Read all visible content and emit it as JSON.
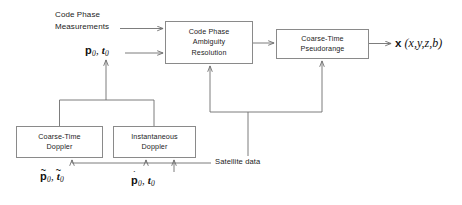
{
  "diagram": {
    "background_color": "#ffffff",
    "line_color": "#6e6e6e",
    "box_border_color": "#8a8a8a",
    "text_color": "#1c1c1c"
  },
  "boxes": [
    {
      "id": "code-phase-ambiguity-resolution",
      "lines": [
        "Code Phase",
        "Ambiguity",
        "Resolution"
      ],
      "x": 165,
      "y": 21,
      "w": 88,
      "h": 43
    },
    {
      "id": "coarse-time-pseudorange",
      "lines": [
        "Coarse-Time",
        "Pseudorange"
      ],
      "x": 276,
      "y": 29,
      "w": 93,
      "h": 30
    },
    {
      "id": "coarse-time-doppler",
      "lines": [
        "Coarse-Time",
        "Doppler"
      ],
      "x": 16,
      "y": 126,
      "w": 87,
      "h": 32
    },
    {
      "id": "instantaneous-doppler",
      "lines": [
        "Instantaneous",
        "Doppler"
      ],
      "x": 113,
      "y": 126,
      "w": 83,
      "h": 32
    }
  ],
  "labels": {
    "code_phase_measurements": {
      "line1": "Code Phase",
      "line2": "Measurements",
      "x": 55,
      "y": 9
    },
    "satellite_data": {
      "text": "Satellite data",
      "x": 215,
      "y": 156
    }
  },
  "math_labels": {
    "p0_t0_input": {
      "p": "p",
      "p_sub": "0",
      "comma": ",",
      "t": "t",
      "t_sub": "0",
      "p_accent": "",
      "t_accent": "",
      "x": 85,
      "y": 46
    },
    "p0_t0_tilde": {
      "p": "p",
      "p_sub": "0",
      "comma": ",",
      "t": "t",
      "t_sub": "0",
      "p_accent": "~",
      "t_accent": "~",
      "x": 40,
      "y": 172
    },
    "pdot0_t0": {
      "p": "p",
      "p_sub": "0",
      "comma": ",",
      "t": "t",
      "t_sub": "0",
      "p_accent": "˙",
      "t_accent": "",
      "x": 131,
      "y": 176
    }
  },
  "output": {
    "vector_symbol": "x",
    "components": "(x,y,z,b)",
    "x": 395,
    "y": 36
  },
  "connections": [
    {
      "id": "measurements-to-ambiguity",
      "from": "code-phase-measurements-label",
      "to": "code-phase-ambiguity-resolution"
    },
    {
      "id": "p0t0-to-ambiguity",
      "from": "p0-t0-label",
      "to": "code-phase-ambiguity-resolution"
    },
    {
      "id": "ambiguity-to-pseudorange",
      "from": "code-phase-ambiguity-resolution",
      "to": "coarse-time-pseudorange"
    },
    {
      "id": "pseudorange-to-output",
      "from": "coarse-time-pseudorange",
      "to": "output-vector"
    },
    {
      "id": "doppler-merge-to-p0t0",
      "from": "doppler-boxes",
      "to": "p0-t0-label"
    },
    {
      "id": "satellite-to-ambiguity",
      "from": "satellite-data-label",
      "to": "code-phase-ambiguity-resolution"
    },
    {
      "id": "satellite-to-pseudorange",
      "from": "satellite-data-label",
      "to": "coarse-time-pseudorange"
    },
    {
      "id": "satellite-to-coarse-doppler",
      "from": "satellite-data-label",
      "to": "coarse-time-doppler"
    },
    {
      "id": "satellite-to-instantaneous-doppler",
      "from": "satellite-data-label",
      "to": "instantaneous-doppler"
    },
    {
      "id": "tilde-inputs-to-instantaneous-doppler",
      "from": "pdot0-t0-label",
      "to": "instantaneous-doppler"
    }
  ]
}
